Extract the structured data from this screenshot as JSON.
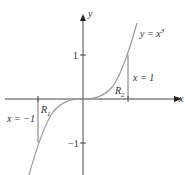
{
  "diagram": {
    "curve_label": "y = x",
    "curve_exponent": "3",
    "x_axis_label": "x",
    "y_axis_label": "y",
    "tick_labels": {
      "y_pos1": "1",
      "y_neg1": "−1"
    },
    "vertical_lines": [
      {
        "label": "x = −1",
        "x": -1
      },
      {
        "label": "x = 1",
        "x": 1
      }
    ],
    "regions": [
      {
        "name": "R",
        "subscript": "1"
      },
      {
        "name": "R",
        "subscript": "2"
      }
    ],
    "colors": {
      "axis": "#444444",
      "curve": "#999999"
    }
  }
}
